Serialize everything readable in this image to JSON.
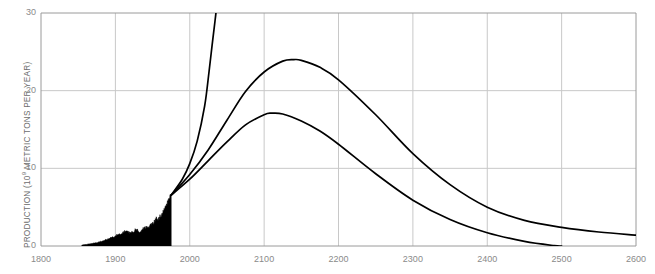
{
  "chart_data": {
    "type": "area",
    "title": "",
    "subtitle": "",
    "xlabel": "",
    "ylabel": "PRODUCTION (10⁹ METRIC TONS PER YEAR)",
    "ylabel_base": "PRODUCTION (10",
    "ylabel_exp": "9",
    "ylabel_tail": " METRIC TONS PER YEAR)",
    "xlim": [
      1800,
      2600
    ],
    "ylim": [
      0,
      30
    ],
    "xticks": [
      1800,
      1900,
      2000,
      2100,
      2200,
      2300,
      2400,
      2500,
      2600
    ],
    "xtick_labels": [
      "1800",
      "1900",
      "2000",
      "2100",
      "2200",
      "2300",
      "2400",
      "2500",
      "2600"
    ],
    "yticks": [
      0,
      10,
      20,
      30
    ],
    "ytick_labels": [
      "0",
      "10",
      "20",
      "30"
    ],
    "grid": true,
    "grid_color": "#c8c8c8",
    "axis_color": "#9a9a9a",
    "curve_color": "#000000",
    "fill_color": "#000000",
    "legend_position": "none",
    "series": [
      {
        "name": "historical-production",
        "type": "filled-area",
        "x": [
          1855,
          1860,
          1865,
          1870,
          1875,
          1880,
          1885,
          1890,
          1895,
          1900,
          1905,
          1910,
          1913,
          1918,
          1920,
          1925,
          1929,
          1932,
          1935,
          1938,
          1940,
          1943,
          1945,
          1948,
          1950,
          1953,
          1955,
          1958,
          1960,
          1963,
          1965,
          1968,
          1970,
          1973,
          1975
        ],
        "values": [
          0.12,
          0.18,
          0.25,
          0.34,
          0.42,
          0.55,
          0.68,
          0.88,
          1.02,
          1.28,
          1.48,
          1.72,
          1.9,
          1.72,
          1.58,
          1.9,
          2.12,
          1.66,
          1.92,
          2.18,
          2.22,
          2.42,
          2.25,
          2.65,
          2.85,
          3.0,
          3.35,
          3.4,
          3.75,
          4.1,
          4.45,
          4.95,
          5.45,
          6.2,
          6.55
        ]
      },
      {
        "name": "exponential-growth-projection",
        "type": "line",
        "x": [
          1975,
          1990,
          2000,
          2010,
          2020,
          2026,
          2030,
          2034,
          2037
        ],
        "values": [
          6.55,
          8.6,
          10.6,
          13.5,
          18.0,
          22.5,
          25.8,
          29.0,
          31.5
        ]
      },
      {
        "name": "upper-hubbert-projection",
        "type": "line",
        "x": [
          1975,
          2000,
          2025,
          2050,
          2075,
          2100,
          2125,
          2140,
          2150,
          2175,
          2200,
          2250,
          2300,
          2350,
          2400,
          2450,
          2500,
          2550,
          2600
        ],
        "values": [
          6.55,
          9.2,
          12.4,
          16.2,
          19.9,
          22.4,
          23.8,
          24.0,
          23.9,
          23.0,
          21.4,
          16.9,
          11.9,
          7.9,
          5.0,
          3.3,
          2.4,
          1.8,
          1.4
        ]
      },
      {
        "name": "lower-hubbert-projection",
        "type": "line",
        "x": [
          1975,
          2000,
          2025,
          2050,
          2075,
          2100,
          2110,
          2125,
          2150,
          2175,
          2200,
          2250,
          2300,
          2350,
          2400,
          2450,
          2490,
          2500
        ],
        "values": [
          6.55,
          8.6,
          11.0,
          13.4,
          15.6,
          16.9,
          17.1,
          17.0,
          16.1,
          14.8,
          13.1,
          9.3,
          5.9,
          3.4,
          1.7,
          0.6,
          0.05,
          0.0
        ]
      }
    ],
    "annotations": []
  }
}
